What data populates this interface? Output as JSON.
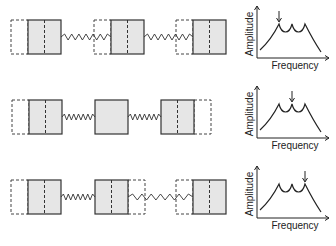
{
  "rows": [
    {
      "mode": 1,
      "masses": [
        {
          "displacement": "left",
          "show_divider": true
        },
        {
          "displacement": "left",
          "show_divider": true
        },
        {
          "displacement": "left",
          "show_divider": true
        }
      ],
      "highlighted_peak": 1
    },
    {
      "mode": 2,
      "masses": [
        {
          "displacement": "left",
          "show_divider": true
        },
        {
          "displacement": "none",
          "show_divider": false
        },
        {
          "displacement": "right",
          "show_divider": true
        }
      ],
      "highlighted_peak": 2
    },
    {
      "mode": 3,
      "masses": [
        {
          "displacement": "left",
          "show_divider": true
        },
        {
          "displacement": "right",
          "show_divider": true
        },
        {
          "displacement": "left",
          "show_divider": true
        }
      ],
      "highlighted_peak": 3
    }
  ],
  "graph": {
    "x_label": "Frequency",
    "y_label": "Amplitude",
    "peaks": 3
  }
}
